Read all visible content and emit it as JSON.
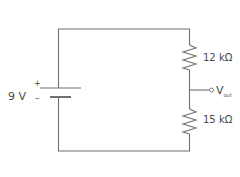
{
  "diagram": {
    "type": "voltage-divider-circuit",
    "source": {
      "value_label": "9 V",
      "plus_label": "+",
      "minus_label": "–"
    },
    "resistors": [
      {
        "label": "12 kΩ"
      },
      {
        "label": "15 kΩ"
      }
    ],
    "output": {
      "label_main": "V",
      "label_sub": "out"
    },
    "colors": {
      "wire": "#707070",
      "text": "#4a4a4a",
      "background": "#ffffff"
    }
  }
}
